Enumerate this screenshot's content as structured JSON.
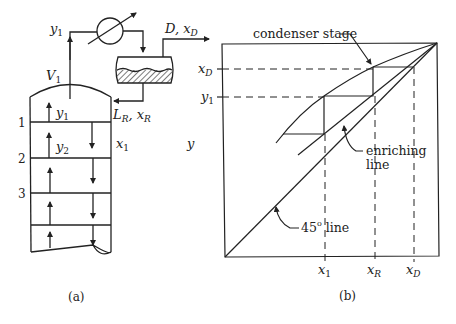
{
  "panel_a": {
    "caption": "(a)",
    "labels": {
      "y1_top": "y",
      "y1_top_sub": "1",
      "V1": "V",
      "V1_sub": "1",
      "D_xD": "D, x",
      "D_xD_sub": "D",
      "LR_xR": "L",
      "LR_sub": "R",
      "xR_text": ", x",
      "xR_sub": "R",
      "y1_in": "y",
      "y1_in_sub": "1",
      "y2": "y",
      "y2_sub": "2",
      "x1": "x",
      "x1_sub": "1"
    },
    "plate_numbers": [
      "1",
      "2",
      "3"
    ]
  },
  "panel_b": {
    "caption": "(b)",
    "y_axis_label": "y",
    "y_ticks": [
      {
        "label": "x",
        "sub": "D"
      },
      {
        "label": "y",
        "sub": "1"
      }
    ],
    "x_ticks": [
      {
        "label": "x",
        "sub": "1"
      },
      {
        "label": "x",
        "sub": "R"
      },
      {
        "label": "x",
        "sub": "D"
      }
    ],
    "annotations": {
      "condenser_stage": "condenser stage",
      "enriching_line_1": "enriching",
      "enriching_line_2": "line",
      "line_45": "45",
      "line_45_deg": "o",
      "line_45_suffix": " line"
    }
  }
}
